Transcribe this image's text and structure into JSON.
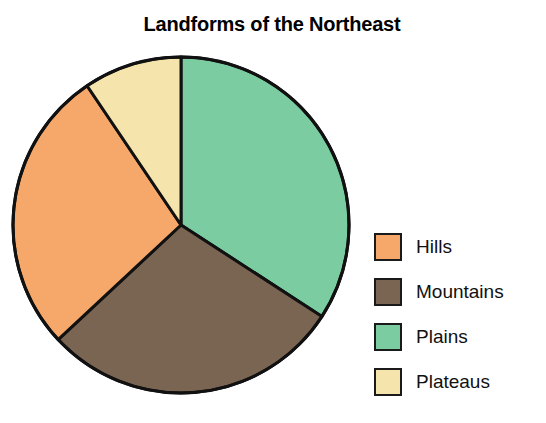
{
  "chart_data": {
    "type": "pie",
    "title": "Landforms of the Northeast",
    "xlabel": "",
    "ylabel": "",
    "legend_position": "right",
    "grid": false,
    "start_angle_deg": 0,
    "direction": "clockwise",
    "categories": [
      "Plains",
      "Mountains",
      "Hills",
      "Plateaus"
    ],
    "values": [
      34,
      29,
      27.5,
      9.5
    ],
    "units": "percent",
    "slices": [
      {
        "label": "Plains",
        "value": 34,
        "angle_deg": 123,
        "color": "#7CCCA2",
        "start_deg": 0,
        "end_deg": 123
      },
      {
        "label": "Mountains",
        "value": 29,
        "angle_deg": 104,
        "color": "#7A6452",
        "start_deg": 123,
        "end_deg": 227
      },
      {
        "label": "Hills",
        "value": 27.5,
        "angle_deg": 99,
        "color": "#F5A86A",
        "start_deg": 227,
        "end_deg": 326
      },
      {
        "label": "Plateaus",
        "value": 9.5,
        "angle_deg": 34,
        "color": "#F5E5AC",
        "start_deg": 326,
        "end_deg": 360
      }
    ],
    "legend": [
      {
        "label": "Hills",
        "color": "#F5A86A"
      },
      {
        "label": "Mountains",
        "color": "#7A6452"
      },
      {
        "label": "Plains",
        "color": "#7CCCA2"
      },
      {
        "label": "Plateaus",
        "color": "#F5E5AC"
      }
    ],
    "style": {
      "background": "#FFFFFF",
      "outline_color": "#111111",
      "outline_width": 3,
      "center_x": 181,
      "center_y": 225,
      "radius": 168
    }
  }
}
